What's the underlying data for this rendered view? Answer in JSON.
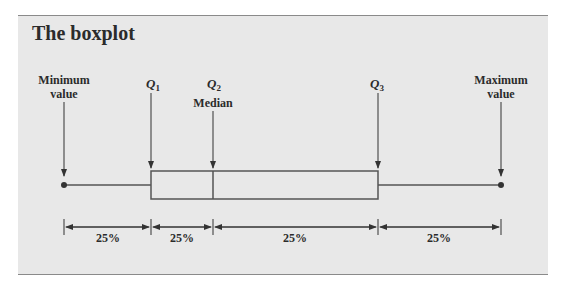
{
  "title": "The boxplot",
  "labels": {
    "minimum": [
      "Minimum",
      "value"
    ],
    "q1": "Q",
    "q1_sub": "1",
    "q2": "Q",
    "q2_sub": "2",
    "median": "Median",
    "q3": "Q",
    "q3_sub": "3",
    "maximum": [
      "Maximum",
      "value"
    ]
  },
  "segments": [
    "25%",
    "25%",
    "25%",
    "25%"
  ],
  "colors": {
    "panel": "#e8e8e8",
    "line": "#555555",
    "text": "#2b2b2b"
  }
}
